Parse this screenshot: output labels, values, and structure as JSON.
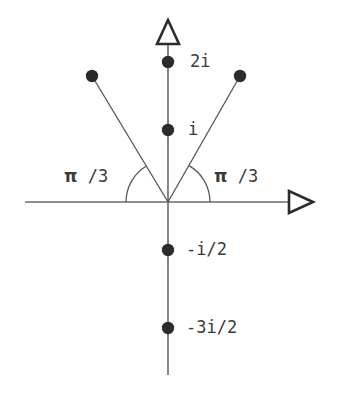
{
  "figure": {
    "type": "complex-plane-diagram",
    "title": "",
    "background_color": "#ffffff",
    "stroke_color": "#555555",
    "point_color": "#2b2b2b",
    "text_color": "#3a3a3a",
    "width": 338,
    "height": 398,
    "origin": {
      "x": 168,
      "y": 202
    }
  },
  "axes": {
    "vertical": {
      "name": "imaginary-axis",
      "x": 168,
      "y_top": 18,
      "y_bottom": 375,
      "arrow": "hollow-triangle-up"
    },
    "horizontal": {
      "name": "real-axis",
      "y": 202,
      "x_left": 25,
      "x_right": 315,
      "arrow": "hollow-triangle-right"
    }
  },
  "points": [
    {
      "id": "p-2i",
      "label": "2i",
      "x": 168,
      "y": 62,
      "label_x": 190,
      "label_y": 53
    },
    {
      "id": "p-i",
      "label": "i",
      "x": 168,
      "y": 130,
      "label_x": 188,
      "label_y": 121
    },
    {
      "id": "p-neg-i-2",
      "label": "-i/2",
      "x": 168,
      "y": 250,
      "label_x": 186,
      "label_y": 241
    },
    {
      "id": "p-neg-3i-2",
      "label": "-3i/2",
      "x": 168,
      "y": 328,
      "label_x": 186,
      "label_y": 319
    },
    {
      "id": "p-left-ray",
      "label": "",
      "x": 92,
      "y": 76,
      "label_x": 0,
      "label_y": 0
    },
    {
      "id": "p-right-ray",
      "label": "",
      "x": 240,
      "y": 76,
      "label_x": 0,
      "label_y": 0
    }
  ],
  "rays": [
    {
      "id": "ray-left",
      "from_x": 168,
      "from_y": 202,
      "to_x": 92,
      "to_y": 76
    },
    {
      "id": "ray-right",
      "from_x": 168,
      "from_y": 202,
      "to_x": 240,
      "to_y": 76
    }
  ],
  "angle_arcs": [
    {
      "id": "arc-left",
      "radius": 42,
      "start_deg": 180,
      "end_deg": 121
    },
    {
      "id": "arc-right",
      "radius": 42,
      "start_deg": 0,
      "end_deg": 60
    }
  ],
  "angle_labels": [
    {
      "id": "angle-label-left",
      "pi": "π",
      "rest": " /3",
      "x": 64,
      "y": 168
    },
    {
      "id": "angle-label-right",
      "pi": "π",
      "rest": " /3",
      "x": 214,
      "y": 168
    }
  ]
}
